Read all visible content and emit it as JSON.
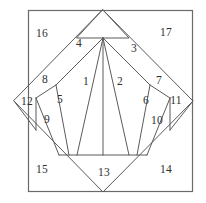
{
  "figure": {
    "colors": {
      "background": "#ffffff",
      "line": "#5b5b5b",
      "frame": "#6a6a6a",
      "label": "#2e2e2e"
    },
    "frame": {
      "left": 28,
      "top": 10,
      "right": 193,
      "bottom": 192
    },
    "diamond": {
      "top": [
        103,
        10
      ],
      "right": [
        193,
        101
      ],
      "bottom": [
        103,
        192
      ],
      "left": [
        14,
        101
      ]
    },
    "regions": [
      {
        "id": "region-1",
        "label": "1",
        "x": 86,
        "y": 82
      },
      {
        "id": "region-2",
        "label": "2",
        "x": 120,
        "y": 82
      },
      {
        "id": "region-3",
        "label": "3",
        "x": 134,
        "y": 49
      },
      {
        "id": "region-4",
        "label": "4",
        "x": 79,
        "y": 44
      },
      {
        "id": "region-5",
        "label": "5",
        "x": 60,
        "y": 100
      },
      {
        "id": "region-6",
        "label": "6",
        "x": 146,
        "y": 101
      },
      {
        "id": "region-7",
        "label": "7",
        "x": 159,
        "y": 81
      },
      {
        "id": "region-8",
        "label": "8",
        "x": 45,
        "y": 80
      },
      {
        "id": "region-9",
        "label": "9",
        "x": 47,
        "y": 120
      },
      {
        "id": "region-10",
        "label": "10",
        "x": 157,
        "y": 121
      },
      {
        "id": "region-11",
        "label": "11",
        "x": 176,
        "y": 101
      },
      {
        "id": "region-12",
        "label": "12",
        "x": 27,
        "y": 102
      },
      {
        "id": "region-13",
        "label": "13",
        "x": 104,
        "y": 173
      },
      {
        "id": "region-14",
        "label": "14",
        "x": 166,
        "y": 170
      },
      {
        "id": "region-15",
        "label": "15",
        "x": 42,
        "y": 170
      },
      {
        "id": "region-16",
        "label": "16",
        "x": 42,
        "y": 34
      },
      {
        "id": "region-17",
        "label": "17",
        "x": 166,
        "y": 33
      }
    ],
    "edges": {
      "diamond_outline": "M 103 10 L 193 101 L 103 192 L 14 101 Z",
      "fan_rays": [
        "M 103 38 L 103 155",
        "M 103 38 L 77 155",
        "M 103 38 L 129 155",
        "M 103 38 L 56 85",
        "M 103 38 L 150 85",
        "M 56 85 L 69 155",
        "M 150 85 L 137 155",
        "M 56 85 L 36 98",
        "M 150 85 L 170 98",
        "M 36 98 L 59 155",
        "M 170 98 L 147 155",
        "M 36 98 L 36 130",
        "M 170 98 L 170 130",
        "M 36 130 L 14 101",
        "M 170 130 L 193 101",
        "M 59 155 L 147 155",
        "M 59 155 L 103 192",
        "M 147 155 L 103 192"
      ],
      "apex_cap": "M 103 10 L 129 38 L 103 38 L 77 38 Z"
    }
  }
}
